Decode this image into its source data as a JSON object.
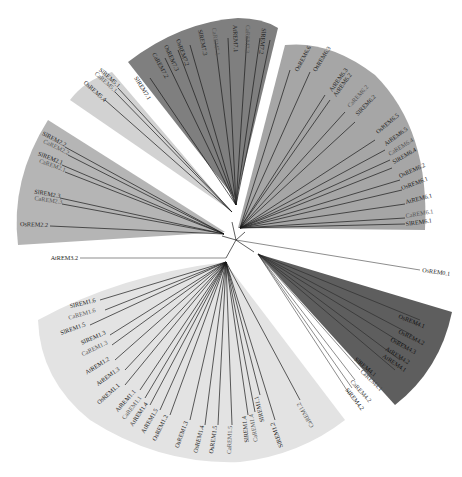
{
  "diagram": {
    "type": "circular-phylogenetic-tree",
    "root": {
      "x": 236,
      "y": 240
    },
    "clades": [
      {
        "id": "group-7",
        "fill": "#7f7f7f",
        "leaves": [
          "SlREM7.1",
          "CaREM7.2",
          "OsREM7.3",
          "OsREM7.2",
          "SlREM7.3",
          "CaREM7.1",
          "AtREM7.1",
          "CaREM7.3",
          "SlREM7.2"
        ]
      },
      {
        "id": "group-6",
        "fill": "#a6a6a6",
        "leaves": [
          "OsREM6.6",
          "OsREM6.3",
          "AtREM6.3",
          "AtREM6.2",
          "CaREM6.2",
          "SlREM6.2",
          "OsREM6.5",
          "AtREM6.5",
          "CaREM6.4",
          "SlREM6.4",
          "OsREM6.2",
          "OsREM6.1",
          "AtREM6.1",
          "CaREM6.1",
          "SlREM6.1"
        ]
      },
      {
        "id": "group-4",
        "fill": "#5e5e5e",
        "leaves": [
          "OsREM4.1",
          "OsREM4.2",
          "OsREM4.3",
          "AtREM4.2",
          "AtREM4.1",
          "SlREM4.1",
          "CaREM4.1",
          "CaREM4.2",
          "SlREM4.2"
        ]
      },
      {
        "id": "group-1",
        "fill": "#e3e3e3",
        "leaves": [
          "SlREM1.6",
          "CaREM1.6",
          "SlREM1.5",
          "SlREM1.3",
          "CaREM1.3",
          "AtREM1.2",
          "AtREM1.3",
          "OsREM1.1",
          "AtREM1.1",
          "CaREM1.1",
          "AtREM1.4",
          "AtREM1.5",
          "OsREM1.2",
          "OsREM1.3",
          "OsREM1.4",
          "OsREM1.5",
          "CaREM1.5",
          "SlREM1.4",
          "CaREM1.4",
          "SlREM1.1",
          "SlREM1.2",
          "CaREM1.2"
        ]
      },
      {
        "id": "group-2",
        "fill": "#b5b5b5",
        "leaves": [
          "SlREM2.2",
          "CaREM2.2",
          "SlREM2.1",
          "CaREM2.1",
          "SlREM2.3",
          "CaREM2.3",
          "OsREM2.2"
        ]
      },
      {
        "id": "group-5",
        "fill": "#d2d2d2",
        "leaves": [
          "SlREM5.1",
          "CaREM5.1",
          "OsREM5.4"
        ]
      }
    ],
    "outgroups": [
      {
        "label": "AtREM3.2"
      },
      {
        "label": "OsREM0.1"
      }
    ]
  }
}
